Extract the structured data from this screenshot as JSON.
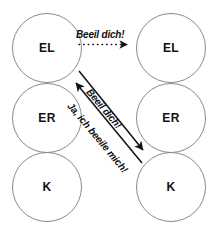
{
  "diagram": {
    "type": "communication-diagram",
    "background_color": "#ffffff",
    "circle_stroke_color": "#8a8a8a",
    "text_color": "#111111",
    "nodes": [
      {
        "id": "top-left",
        "label": "EL",
        "column": "left",
        "row": 1
      },
      {
        "id": "top-right",
        "label": "EL",
        "column": "right",
        "row": 1
      },
      {
        "id": "middle-left",
        "label": "ER",
        "column": "left",
        "row": 2
      },
      {
        "id": "middle-right",
        "label": "ER",
        "column": "right",
        "row": 2
      },
      {
        "id": "bottom-left",
        "label": "K",
        "column": "left",
        "row": 3
      },
      {
        "id": "bottom-right",
        "label": "K",
        "column": "right",
        "row": 3
      }
    ],
    "arrows": [
      {
        "id": "top-dotted-arrow",
        "label": "Beeil dich!",
        "style": "dotted",
        "direction": "left-to-right",
        "from": "top-left",
        "to": "top-right"
      },
      {
        "id": "diagonal-down-arrow",
        "label": "Beeil dich!",
        "style": "solid",
        "direction": "down-right",
        "from": "top-left",
        "to": "bottom-right"
      },
      {
        "id": "diagonal-up-arrow",
        "label": "Ja, ich beeile mich!",
        "style": "solid",
        "direction": "up-left",
        "from": "bottom-right",
        "to": "top-left"
      }
    ]
  }
}
